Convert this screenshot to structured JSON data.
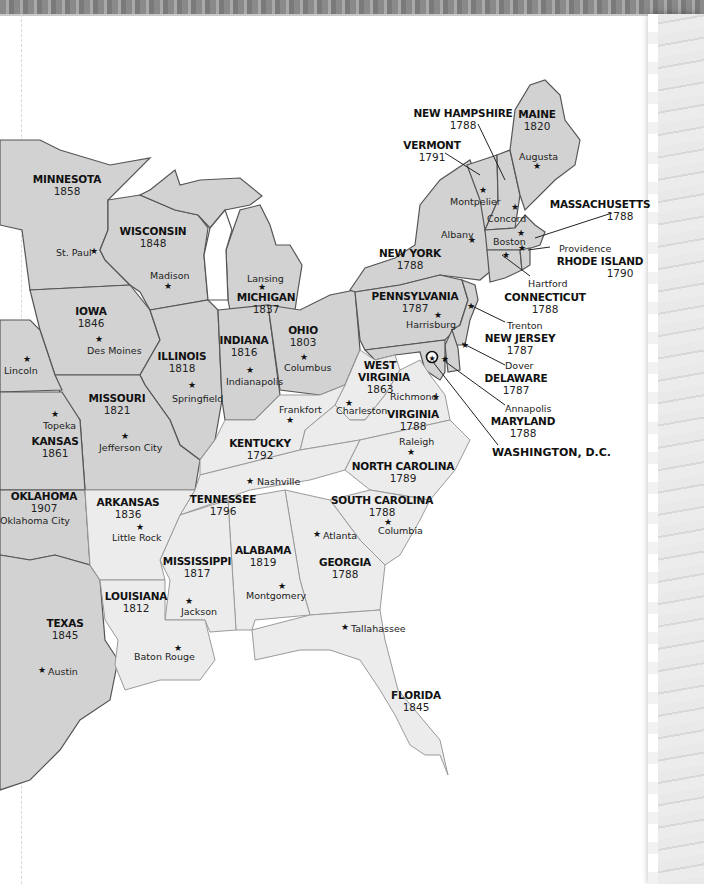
{
  "map": {
    "type": "US statehood map (eastern United States)",
    "colors": {
      "original_and_early": "#ececec",
      "later_states": "#d2d2d2",
      "border_dark": "#555555",
      "border_light": "#9a9a9a",
      "background": "#ffffff"
    },
    "states": [
      {
        "name": "MAINE",
        "year": "1820",
        "capital": "Augusta"
      },
      {
        "name": "NEW HAMPSHIRE",
        "year": "1788",
        "capital": "Concord"
      },
      {
        "name": "VERMONT",
        "year": "1791",
        "capital": "Montpelier"
      },
      {
        "name": "MASSACHUSETTS",
        "year": "1788",
        "capital": "Boston"
      },
      {
        "name": "RHODE ISLAND",
        "year": "1790",
        "capital": "Providence"
      },
      {
        "name": "CONNECTICUT",
        "year": "1788",
        "capital": "Hartford"
      },
      {
        "name": "NEW YORK",
        "year": "1788",
        "capital": "Albany"
      },
      {
        "name": "PENNSYLVANIA",
        "year": "1787",
        "capital": "Harrisburg"
      },
      {
        "name": "NEW JERSEY",
        "year": "1787",
        "capital": "Trenton"
      },
      {
        "name": "DELAWARE",
        "year": "1787",
        "capital": "Dover"
      },
      {
        "name": "MARYLAND",
        "year": "1788",
        "capital": "Annapolis"
      },
      {
        "name": "MINNESOTA",
        "year": "1858",
        "capital": "St. Paul"
      },
      {
        "name": "WISCONSIN",
        "year": "1848",
        "capital": "Madison"
      },
      {
        "name": "MICHIGAN",
        "year": "1837",
        "capital": "Lansing"
      },
      {
        "name": "IOWA",
        "year": "1846",
        "capital": "Des Moines"
      },
      {
        "name": "ILLINOIS",
        "year": "1818",
        "capital": "Springfield"
      },
      {
        "name": "INDIANA",
        "year": "1816",
        "capital": "Indianapolis"
      },
      {
        "name": "OHIO",
        "year": "1803",
        "capital": "Columbus"
      },
      {
        "name": "WEST VIRGINIA",
        "year": "1863",
        "capital": "Charleston"
      },
      {
        "name": "VIRGINIA",
        "year": "1788",
        "capital": "Richmond"
      },
      {
        "name": "MISSOURI",
        "year": "1821",
        "capital": "Jefferson City"
      },
      {
        "name": "KANSAS",
        "year": "1861",
        "capital": "Topeka"
      },
      {
        "name": "KENTUCKY",
        "year": "1792",
        "capital": "Frankfort"
      },
      {
        "name": "NORTH CAROLINA",
        "year": "1789",
        "capital": "Raleigh"
      },
      {
        "name": "TENNESSEE",
        "year": "1796",
        "capital": "Nashville"
      },
      {
        "name": "SOUTH CAROLINA",
        "year": "1788",
        "capital": "Columbia"
      },
      {
        "name": "OKLAHOMA",
        "year": "1907",
        "capital": "Oklahoma City"
      },
      {
        "name": "ARKANSAS",
        "year": "1836",
        "capital": "Little Rock"
      },
      {
        "name": "MISSISSIPPI",
        "year": "1817",
        "capital": "Jackson"
      },
      {
        "name": "ALABAMA",
        "year": "1819",
        "capital": "Montgomery"
      },
      {
        "name": "GEORGIA",
        "year": "1788",
        "capital": "Atlanta"
      },
      {
        "name": "LOUISIANA",
        "year": "1812",
        "capital": "Baton Rouge"
      },
      {
        "name": "TEXAS",
        "year": "1845",
        "capital": "Austin"
      },
      {
        "name": "FLORIDA",
        "year": "1845",
        "capital": "Tallahassee"
      }
    ],
    "other_capitals": [
      "Lincoln"
    ],
    "national_capital": {
      "name": "WASHINGTON, D.C.",
      "icon": "star-in-circle-icon"
    },
    "capital_icon": "star-icon"
  }
}
